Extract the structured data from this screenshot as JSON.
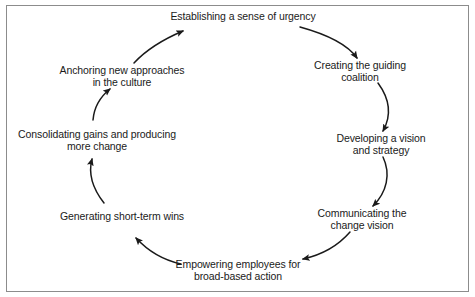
{
  "diagram": {
    "type": "cycle",
    "background_color": "#ffffff",
    "border_color": "#8c8c8c",
    "text_color": "#1a1a1a",
    "arrow_color": "#1a1a1a",
    "direction": "clockwise",
    "step_count": 8,
    "steps": [
      {
        "index": 1,
        "label": "Establishing a sense of urgency",
        "x": 243,
        "y": 17,
        "angle_deg": 270
      },
      {
        "index": 2,
        "label": "Creating the guiding coalition",
        "x": 360,
        "y": 71,
        "angle_deg": 315
      },
      {
        "index": 3,
        "label": "Developing a vision and strategy",
        "x": 381,
        "y": 144,
        "angle_deg": 0
      },
      {
        "index": 4,
        "label": "Communicating the change vision",
        "x": 362,
        "y": 219,
        "angle_deg": 45
      },
      {
        "index": 5,
        "label": "Empowering employees for\nbroad-based action",
        "x": 238,
        "y": 270,
        "angle_deg": 90
      },
      {
        "index": 6,
        "label": "Generating short-term wins",
        "x": 122,
        "y": 217,
        "angle_deg": 135
      },
      {
        "index": 7,
        "label": "Consolidating gains and producing\nmore change",
        "x": 97,
        "y": 140,
        "angle_deg": 180
      },
      {
        "index": 8,
        "label": "Anchoring new approaches\nin the culture",
        "x": 122,
        "y": 76,
        "angle_deg": 225
      }
    ],
    "connectors": [
      {
        "from": 1,
        "to": 2,
        "name": "arc-urgency-to-coalition"
      },
      {
        "from": 2,
        "to": 3,
        "name": "arc-coalition-to-vision"
      },
      {
        "from": 3,
        "to": 4,
        "name": "arc-vision-to-communicating"
      },
      {
        "from": 4,
        "to": 5,
        "name": "arc-communicating-to-empowering"
      },
      {
        "from": 5,
        "to": 6,
        "name": "arc-empowering-to-wins"
      },
      {
        "from": 6,
        "to": 7,
        "name": "arc-wins-to-consolidating"
      },
      {
        "from": 7,
        "to": 8,
        "name": "arc-consolidating-to-anchoring"
      },
      {
        "from": 8,
        "to": 1,
        "name": "arc-anchoring-to-urgency"
      }
    ]
  }
}
